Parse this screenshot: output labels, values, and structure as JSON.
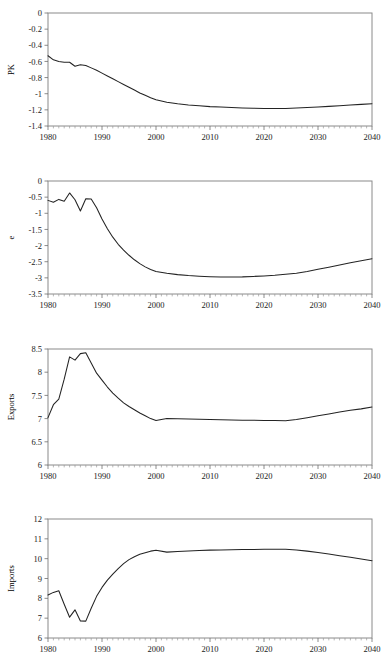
{
  "figure": {
    "background_color": "#ffffff",
    "line_color": "#232323",
    "frame_color": "#8a8a8a",
    "panel_count": 4
  },
  "chart_data": [
    {
      "type": "line",
      "title": "",
      "xlabel": "",
      "ylabel": "PK",
      "xlim": [
        1980,
        2040
      ],
      "ylim": [
        -1.4,
        0
      ],
      "grid": false,
      "legend": null,
      "xticks": [
        1980,
        1990,
        2000,
        2010,
        2020,
        2030,
        2040
      ],
      "xticklabels": [
        "1980",
        "1990",
        "2000",
        "2010",
        "2020",
        "2030",
        "2040"
      ],
      "yticks": [
        0,
        -0.2,
        -0.4,
        -0.6,
        -0.8,
        -1,
        -1.2,
        -1.4
      ],
      "yticklabels": [
        "0",
        "-0.2",
        "-0.4",
        "-0.6",
        "-0.8",
        "-1",
        "-1.2",
        "-1.4"
      ],
      "x": [
        1980,
        1981,
        1982,
        1983,
        1984,
        1985,
        1986,
        1987,
        1988,
        1989,
        1990,
        1991,
        1992,
        1993,
        1994,
        1995,
        1996,
        1997,
        1998,
        1999,
        2000,
        2002,
        2004,
        2006,
        2008,
        2010,
        2012,
        2014,
        2016,
        2018,
        2020,
        2022,
        2024,
        2026,
        2028,
        2030,
        2032,
        2034,
        2036,
        2038,
        2040
      ],
      "values": [
        -0.53,
        -0.58,
        -0.6,
        -0.61,
        -0.61,
        -0.66,
        -0.64,
        -0.65,
        -0.68,
        -0.71,
        -0.745,
        -0.78,
        -0.815,
        -0.85,
        -0.885,
        -0.92,
        -0.955,
        -0.99,
        -1.02,
        -1.05,
        -1.075,
        -1.105,
        -1.125,
        -1.14,
        -1.15,
        -1.16,
        -1.165,
        -1.172,
        -1.177,
        -1.18,
        -1.182,
        -1.183,
        -1.182,
        -1.178,
        -1.172,
        -1.165,
        -1.157,
        -1.149,
        -1.14,
        -1.132,
        -1.125
      ]
    },
    {
      "type": "line",
      "title": "",
      "xlabel": "",
      "ylabel": "e",
      "xlim": [
        1980,
        2040
      ],
      "ylim": [
        -3.5,
        0
      ],
      "grid": false,
      "legend": null,
      "xticks": [
        1980,
        1990,
        2000,
        2010,
        2020,
        2030,
        2040
      ],
      "xticklabels": [
        "1980",
        "1990",
        "2000",
        "2010",
        "2020",
        "2030",
        "2040"
      ],
      "yticks": [
        0,
        -0.5,
        -1,
        -1.5,
        -2,
        -2.5,
        -3,
        -3.5
      ],
      "yticklabels": [
        "0",
        "-0.5",
        "-1",
        "-1.5",
        "-2",
        "-2.5",
        "-3",
        "-3.5"
      ],
      "x": [
        1980,
        1981,
        1982,
        1983,
        1984,
        1985,
        1986,
        1987,
        1988,
        1989,
        1990,
        1991,
        1992,
        1993,
        1994,
        1995,
        1996,
        1997,
        1998,
        1999,
        2000,
        2002,
        2004,
        2006,
        2008,
        2010,
        2012,
        2014,
        2016,
        2018,
        2020,
        2022,
        2024,
        2026,
        2028,
        2030,
        2032,
        2034,
        2036,
        2038,
        2040
      ],
      "values": [
        -0.6,
        -0.66,
        -0.57,
        -0.63,
        -0.37,
        -0.58,
        -0.93,
        -0.55,
        -0.56,
        -0.83,
        -1.18,
        -1.48,
        -1.74,
        -1.96,
        -2.14,
        -2.3,
        -2.44,
        -2.56,
        -2.66,
        -2.74,
        -2.8,
        -2.86,
        -2.9,
        -2.93,
        -2.95,
        -2.965,
        -2.975,
        -2.975,
        -2.97,
        -2.955,
        -2.94,
        -2.92,
        -2.89,
        -2.855,
        -2.8,
        -2.735,
        -2.67,
        -2.6,
        -2.53,
        -2.47,
        -2.41
      ]
    },
    {
      "type": "line",
      "title": "",
      "xlabel": "",
      "ylabel": "Exports",
      "xlim": [
        1980,
        2040
      ],
      "ylim": [
        6,
        8.5
      ],
      "grid": false,
      "legend": null,
      "xticks": [
        1980,
        1990,
        2000,
        2010,
        2020,
        2030,
        2040
      ],
      "xticklabels": [
        "1980",
        "1990",
        "2000",
        "2010",
        "2020",
        "2030",
        "2040"
      ],
      "yticks": [
        8.5,
        8,
        7.5,
        7,
        6.5,
        6
      ],
      "yticklabels": [
        "8.5",
        "8",
        "7.5",
        "7",
        "6.5",
        "6"
      ],
      "x": [
        1980,
        1981,
        1982,
        1983,
        1984,
        1985,
        1986,
        1987,
        1988,
        1989,
        1990,
        1991,
        1992,
        1993,
        1994,
        1995,
        1996,
        1997,
        1998,
        1999,
        2000,
        2002,
        2004,
        2006,
        2008,
        2010,
        2012,
        2014,
        2016,
        2018,
        2020,
        2022,
        2024,
        2026,
        2028,
        2030,
        2032,
        2034,
        2036,
        2038,
        2040
      ],
      "values": [
        7.02,
        7.3,
        7.42,
        7.85,
        8.33,
        8.26,
        8.4,
        8.42,
        8.2,
        7.98,
        7.83,
        7.68,
        7.55,
        7.44,
        7.34,
        7.26,
        7.19,
        7.12,
        7.06,
        7.0,
        6.96,
        7.0,
        6.995,
        6.99,
        6.985,
        6.98,
        6.975,
        6.97,
        6.965,
        6.965,
        6.96,
        6.96,
        6.955,
        6.98,
        7.02,
        7.06,
        7.1,
        7.14,
        7.18,
        7.21,
        7.25
      ]
    },
    {
      "type": "line",
      "title": "",
      "xlabel": "",
      "ylabel": "Imports",
      "xlim": [
        1980,
        2040
      ],
      "ylim": [
        6,
        12
      ],
      "grid": false,
      "legend": null,
      "xticks": [
        1980,
        1990,
        2000,
        2010,
        2020,
        2030,
        2040
      ],
      "xticklabels": [
        "1980",
        "1990",
        "2000",
        "2010",
        "2020",
        "2030",
        "2040"
      ],
      "yticks": [
        12,
        11,
        10,
        9,
        8,
        7,
        6
      ],
      "yticklabels": [
        "12",
        "11",
        "10",
        "9",
        "8",
        "7",
        "6"
      ],
      "x": [
        1980,
        1981,
        1982,
        1983,
        1984,
        1985,
        1986,
        1987,
        1988,
        1989,
        1990,
        1991,
        1992,
        1993,
        1994,
        1995,
        1996,
        1997,
        1998,
        1999,
        2000,
        2002,
        2004,
        2006,
        2008,
        2010,
        2012,
        2014,
        2016,
        2018,
        2020,
        2022,
        2024,
        2026,
        2028,
        2030,
        2032,
        2034,
        2036,
        2038,
        2040
      ],
      "values": [
        8.17,
        8.3,
        8.38,
        7.7,
        7.05,
        7.42,
        6.86,
        6.85,
        7.5,
        8.1,
        8.55,
        8.92,
        9.22,
        9.5,
        9.75,
        9.95,
        10.1,
        10.22,
        10.3,
        10.38,
        10.42,
        10.33,
        10.36,
        10.39,
        10.41,
        10.43,
        10.44,
        10.45,
        10.46,
        10.465,
        10.47,
        10.47,
        10.47,
        10.44,
        10.38,
        10.31,
        10.23,
        10.15,
        10.07,
        9.98,
        9.9
      ]
    }
  ]
}
